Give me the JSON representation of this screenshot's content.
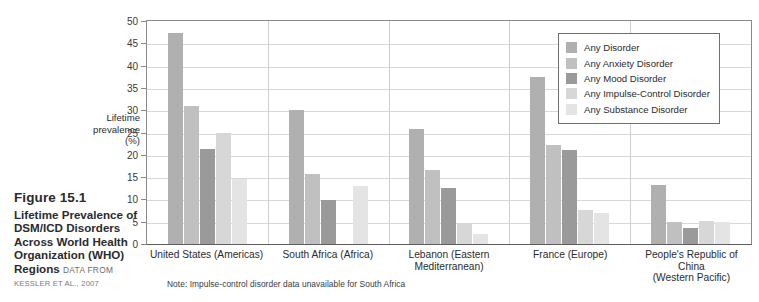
{
  "caption": {
    "figure_number": "Figure 15.1",
    "title": "Lifetime Prevalence of DSM/ICD Disorders Across World Health Organization (WHO) Regions",
    "data_from_label": "DATA FROM",
    "source": "KESSLER ET AL., 2007"
  },
  "note": "Note: Impulse-control disorder data unavailable for South Africa",
  "chart_data": {
    "type": "bar",
    "title": "Lifetime Prevalence of DSM/ICD Disorders Across World Health Organization (WHO) Regions",
    "xlabel": "",
    "ylabel": "Lifetime prevalence (%)",
    "ylabel_lines": [
      "Lifetime",
      "prevalence",
      "(%)"
    ],
    "ylim": [
      0,
      50
    ],
    "yticks": [
      0,
      5,
      10,
      15,
      20,
      25,
      30,
      35,
      40,
      45,
      50
    ],
    "grid": true,
    "legend_position": "top-right",
    "categories": [
      "United States (Americas)",
      "South Africa (Africa)",
      "Lebanon (Eastern Mediterranean)",
      "France (Europe)",
      "People's Republic of China (Western Pacific)"
    ],
    "category_lines": [
      [
        "United States (Americas)"
      ],
      [
        "South Africa (Africa)"
      ],
      [
        "Lebanon (Eastern",
        "Mediterranean)"
      ],
      [
        "France (Europe)"
      ],
      [
        "People's Republic of China",
        "(Western Pacific)"
      ]
    ],
    "series": [
      {
        "name": "Any Disorder",
        "color": "#b0b0b0",
        "values": [
          47.4,
          30.0,
          25.8,
          37.5,
          13.2
        ]
      },
      {
        "name": "Any Anxiety Disorder",
        "color": "#c0c0c0",
        "values": [
          31.0,
          15.6,
          16.7,
          22.3,
          5.0
        ]
      },
      {
        "name": "Any Mood Disorder",
        "color": "#9a9a9a",
        "values": [
          21.4,
          9.8,
          12.6,
          21.0,
          3.6
        ]
      },
      {
        "name": "Any Impulse-Control Disorder",
        "color": "#d7d7d7",
        "values": [
          25.0,
          null,
          4.4,
          7.6,
          5.2
        ]
      },
      {
        "name": "Any Substance Disorder",
        "color": "#e4e4e4",
        "values": [
          14.6,
          13.0,
          2.2,
          7.0,
          4.9
        ]
      }
    ]
  }
}
